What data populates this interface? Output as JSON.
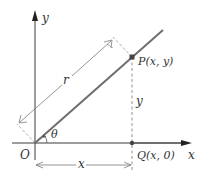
{
  "diagram": {
    "title": "",
    "colors": {
      "axis": "#3a3a3a",
      "ray": "#6e6e6e",
      "dimension": "#7a7a7a",
      "text": "#333333",
      "point": "#444444"
    },
    "axes": {
      "x_label": "x",
      "y_label": "y",
      "origin_label": "O"
    },
    "points": {
      "P": {
        "label": "P(x, y)"
      },
      "Q": {
        "label": "Q(x, 0)"
      }
    },
    "angle_label": "θ",
    "dimensions": {
      "r_label": "r",
      "x_label": "x",
      "y_label": "y"
    }
  }
}
